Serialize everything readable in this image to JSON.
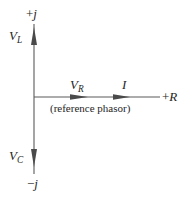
{
  "figure": {
    "type": "phasor-diagram",
    "title": "",
    "background_color": "#ffffff",
    "line_color": "#4a4a4a",
    "text_color": "#262626"
  },
  "axes": {
    "vertical": {
      "positive_label_sign": "+",
      "positive_label_symbol": "j",
      "negative_label_sign": "−",
      "negative_label_symbol": "j",
      "origin_x": 34,
      "origin_y": 97,
      "top_y": 24,
      "bottom_y": 174
    },
    "horizontal": {
      "positive_label_sign": "+",
      "positive_label_symbol": "R",
      "origin_x": 34,
      "origin_y": 97,
      "right_x": 160
    }
  },
  "phasors": [
    {
      "name": "inductor-voltage",
      "symbol": "V",
      "subscript": "L",
      "direction": "up",
      "tip_x": 34,
      "tip_y": 28,
      "tail_x": 34,
      "tail_y": 97
    },
    {
      "name": "capacitor-voltage",
      "symbol": "V",
      "subscript": "C",
      "direction": "down",
      "tip_x": 34,
      "tip_y": 166,
      "tail_x": 34,
      "tail_y": 97
    },
    {
      "name": "resistor-voltage",
      "symbol": "V",
      "subscript": "R",
      "direction": "right",
      "tip_x": 88,
      "tip_y": 97,
      "tail_x": 34,
      "tail_y": 97
    },
    {
      "name": "current",
      "symbol": "I",
      "subscript": "",
      "direction": "right",
      "tip_x": 130,
      "tip_y": 97,
      "tail_x": 34,
      "tail_y": 97
    }
  ],
  "annotation": {
    "reference_phasor_note": "(reference phasor)"
  }
}
